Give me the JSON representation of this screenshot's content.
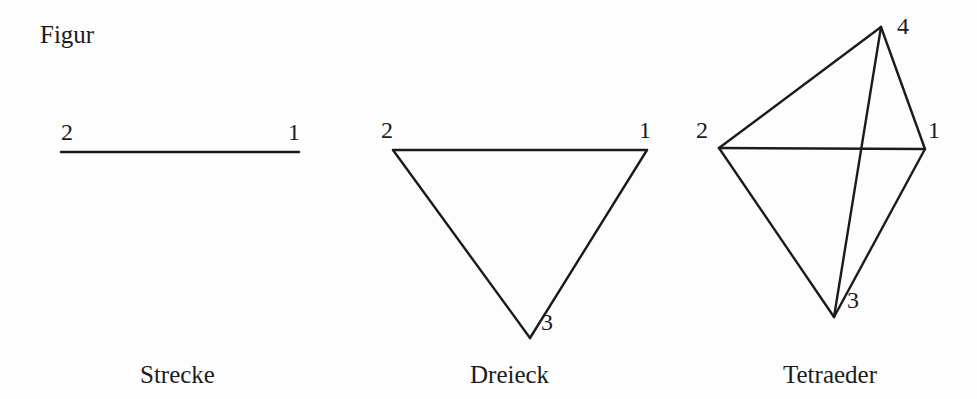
{
  "page": {
    "heading_label": "Figur",
    "background_color": "#fdfdfd",
    "stroke_color": "#1b1b1b",
    "text_color": "#1c1c1c",
    "width": 977,
    "height": 399
  },
  "figures": [
    {
      "name": "strecke",
      "caption": "Strecke",
      "caption_x": 140,
      "caption_y": 362,
      "type": "line-segment",
      "vertices": [
        {
          "id": "1",
          "label": "1",
          "x": 299,
          "y": 152,
          "label_x": 288,
          "label_y": 120
        },
        {
          "id": "2",
          "label": "2",
          "x": 61,
          "y": 152,
          "label_x": 61,
          "label_y": 120
        }
      ],
      "edges": [
        {
          "from": "2",
          "to": "1"
        }
      ]
    },
    {
      "name": "dreieck",
      "caption": "Dreieck",
      "caption_x": 470,
      "caption_y": 362,
      "type": "triangle",
      "vertices": [
        {
          "id": "1",
          "label": "1",
          "x": 647,
          "y": 150,
          "label_x": 639,
          "label_y": 118
        },
        {
          "id": "2",
          "label": "2",
          "x": 393,
          "y": 150,
          "label_x": 381,
          "label_y": 118
        },
        {
          "id": "3",
          "label": "3",
          "x": 530,
          "y": 338,
          "label_x": 541,
          "label_y": 310
        }
      ],
      "edges": [
        {
          "from": "2",
          "to": "1"
        },
        {
          "from": "2",
          "to": "3"
        },
        {
          "from": "3",
          "to": "1"
        }
      ]
    },
    {
      "name": "tetraeder",
      "caption": "Tetraeder",
      "caption_x": 783,
      "caption_y": 362,
      "type": "tetrahedron",
      "vertices": [
        {
          "id": "1",
          "label": "1",
          "x": 925,
          "y": 149,
          "label_x": 928,
          "label_y": 118
        },
        {
          "id": "2",
          "label": "2",
          "x": 719,
          "y": 148,
          "label_x": 696,
          "label_y": 118
        },
        {
          "id": "3",
          "label": "3",
          "x": 834,
          "y": 317,
          "label_x": 847,
          "label_y": 288
        },
        {
          "id": "4",
          "label": "4",
          "x": 881,
          "y": 27,
          "label_x": 897,
          "label_y": 14
        }
      ],
      "edges": [
        {
          "from": "2",
          "to": "1"
        },
        {
          "from": "2",
          "to": "4"
        },
        {
          "from": "4",
          "to": "1"
        },
        {
          "from": "2",
          "to": "3"
        },
        {
          "from": "3",
          "to": "1"
        },
        {
          "from": "4",
          "to": "3"
        }
      ]
    }
  ]
}
